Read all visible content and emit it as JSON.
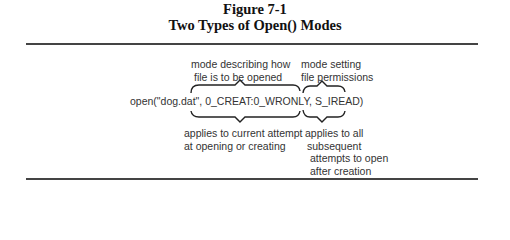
{
  "figure": {
    "number": "Figure 7-1",
    "title": "Two Types of Open() Modes"
  },
  "code_line": "open(\"dog.dat\",  0_CREAT:0_WRONLY, S_IREAD)",
  "annotations": {
    "top_left": [
      "mode describing how",
      "file is to be opened"
    ],
    "top_right": [
      "mode setting",
      "file permissions"
    ],
    "bottom_left": [
      "applies to current attempt",
      "at opening or creating"
    ],
    "bottom_right": [
      "applies to all",
      "subsequent",
      "attempts to open",
      "after creation"
    ]
  },
  "colors": {
    "text": "#333333",
    "rule": "#444444"
  }
}
